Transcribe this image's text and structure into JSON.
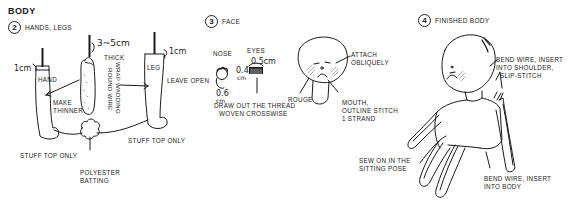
{
  "section_title": "BODY",
  "steps": [
    {
      "number": "2",
      "label": "HANDS, LEGS"
    },
    {
      "number": "3",
      "label": "FACE"
    },
    {
      "number": "4",
      "label": "FINISHED BODY"
    }
  ],
  "hands_legs": {
    "hand_label": "HAND",
    "hand_measure": "1cm",
    "make_thinner": "MAKE THINNER",
    "wire_measure": "3~5cm",
    "thick_label": "THICK",
    "wrap_label_line1": "WRAP WADDING",
    "wrap_label_line2": "ROUND WIRE",
    "leg_label": "LEG",
    "leg_measure": "1cm",
    "leave_open": "LEAVE OPEN",
    "stuff_top_left": "STUFF TOP ONLY",
    "stuff_top_right": "STUFF TOP ONLY",
    "batting_line1": "POLYESTER",
    "batting_line2": "BATTING"
  },
  "face": {
    "nose_label": "NOSE",
    "eyes_label": "EYES",
    "nose_measure_1": "0.6",
    "nose_measure_2": "cm",
    "eye_width": "0.5cm",
    "eye_height_1": "0.4",
    "eye_height_2": "cm",
    "draw_out_line1": "DRAW OUT THE THREAD",
    "draw_out_line2": "WOVEN CROSSWISE",
    "attach_line1": "ATTACH",
    "attach_line2": "OBLIQUELY",
    "rouge": "ROUGE",
    "mouth_line1": "MOUTH,",
    "mouth_line2": "OUTLINE STITCH",
    "mouth_line3": "1 STRAND"
  },
  "finished": {
    "shoulder_line1": "BEND WIRE, INSERT",
    "shoulder_line2": "INTO SHOULDER,",
    "shoulder_line3": "SLIP-STITCH",
    "sew_line1": "SEW ON IN THE",
    "sew_line2": "SITTING POSE",
    "body_line1": "BEND WIRE, INSERT",
    "body_line2": "INTO BODY"
  },
  "colors": {
    "ink": "#1a1a1a",
    "rouge_hatch": "#8a8a8a",
    "background": "#ffffff"
  }
}
